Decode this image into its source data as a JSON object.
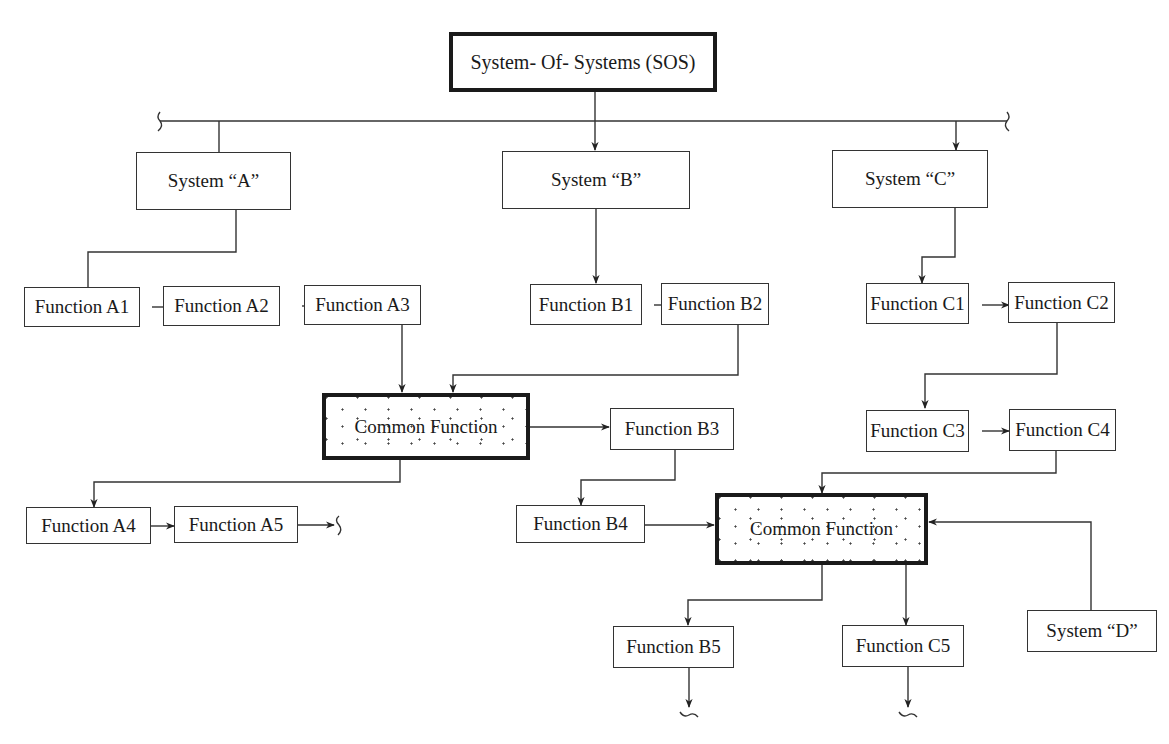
{
  "diagram": {
    "root": {
      "id": "sos",
      "label": "System- Of- Systems (SOS)"
    },
    "systems": [
      {
        "id": "sysA",
        "label": "System “A”"
      },
      {
        "id": "sysB",
        "label": "System “B”"
      },
      {
        "id": "sysC",
        "label": "System “C”"
      },
      {
        "id": "sysD",
        "label": "System “D”"
      }
    ],
    "functions": {
      "a1": "Function A1",
      "a2": "Function A2",
      "a3": "Function A3",
      "a4": "Function A4",
      "a5": "Function A5",
      "b1": "Function B1",
      "b2": "Function B2",
      "b3": "Function B3",
      "b4": "Function B4",
      "b5": "Function B5",
      "c1": "Function C1",
      "c2": "Function C2",
      "c3": "Function C3",
      "c4": "Function C4",
      "c5": "Function C5"
    },
    "common_functions": [
      {
        "id": "common1",
        "label": "Common Function",
        "style": "stippled"
      },
      {
        "id": "common2",
        "label": "Common Function",
        "style": "stippled"
      }
    ],
    "edges": [
      {
        "from": "sos",
        "to": "sysB"
      },
      {
        "from": "bus",
        "to": "sysA"
      },
      {
        "from": "bus",
        "to": "sysC"
      },
      {
        "from": "sysA",
        "to": "a1"
      },
      {
        "from": "a1",
        "to": "a2"
      },
      {
        "from": "a2",
        "to": "a3"
      },
      {
        "from": "sysB",
        "to": "b1"
      },
      {
        "from": "b1",
        "to": "b2"
      },
      {
        "from": "sysC",
        "to": "c1"
      },
      {
        "from": "c1",
        "to": "c2"
      },
      {
        "from": "a3",
        "to": "common1"
      },
      {
        "from": "b2",
        "to": "common1"
      },
      {
        "from": "common1",
        "to": "b3"
      },
      {
        "from": "common1",
        "to": "a4"
      },
      {
        "from": "a4",
        "to": "a5"
      },
      {
        "from": "a5",
        "to": "continuation"
      },
      {
        "from": "b3",
        "to": "b4"
      },
      {
        "from": "c2",
        "to": "c3"
      },
      {
        "from": "c3",
        "to": "c4"
      },
      {
        "from": "c4",
        "to": "common2"
      },
      {
        "from": "b4",
        "to": "common2"
      },
      {
        "from": "sysD",
        "to": "common2"
      },
      {
        "from": "common2",
        "to": "b5"
      },
      {
        "from": "common2",
        "to": "c5"
      },
      {
        "from": "b5",
        "to": "continuation"
      },
      {
        "from": "c5",
        "to": "continuation"
      }
    ],
    "colors": {
      "line": "#333333",
      "thick_border": "#1a1a1a",
      "background": "#ffffff"
    }
  }
}
